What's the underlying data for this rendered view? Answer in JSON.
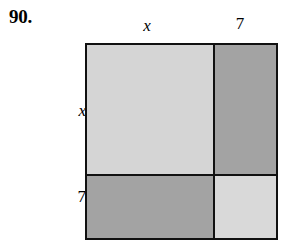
{
  "exercise": {
    "number": "90."
  },
  "figure": {
    "type": "area-model-square",
    "top_labels": [
      {
        "text": "x",
        "style": "italic",
        "segment": "left"
      },
      {
        "text": "7",
        "style": "upright",
        "segment": "right"
      }
    ],
    "left_labels": [
      {
        "text": "x",
        "style": "italic",
        "segment": "top"
      },
      {
        "text": "7",
        "style": "upright",
        "segment": "bottom"
      }
    ],
    "regions": [
      {
        "name": "top-left",
        "product": "x times x",
        "shade": "light"
      },
      {
        "name": "top-right",
        "product": "7 times x",
        "shade": "dark"
      },
      {
        "name": "bottom-left",
        "product": "x times 7",
        "shade": "dark"
      },
      {
        "name": "bottom-right",
        "product": "7 times 7",
        "shade": "light"
      }
    ],
    "colors": {
      "light_shade": "#d5d5d5",
      "light_shade_alt": "#d9d9d9",
      "dark_shade": "#a3a3a3",
      "outline": "#111111",
      "background": "#ffffff",
      "text": "#000000"
    }
  }
}
